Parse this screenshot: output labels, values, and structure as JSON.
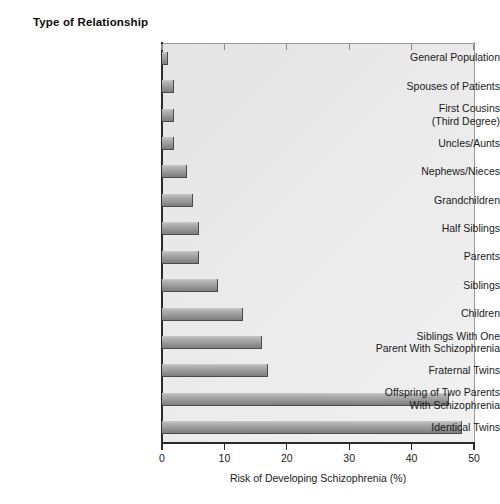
{
  "chart_data": {
    "type": "bar",
    "orientation": "horizontal",
    "title": "Type of Relationship",
    "xlabel": "Risk of Developing Schizophrenia (%)",
    "ylabel": "Type of Relationship",
    "xlim": [
      0,
      50
    ],
    "xticks": [
      0,
      10,
      20,
      30,
      40,
      50
    ],
    "xtick_labels": [
      "0",
      "10",
      "20",
      "30",
      "40",
      "50"
    ],
    "grid": false,
    "legend": null,
    "bar_color": "#9d9d9d",
    "plot_background": "#ebebeb",
    "categories": [
      "General Population",
      "Spouses of Patients",
      "First Cousins\n(Third Degree)",
      "Uncles/Aunts",
      "Nephews/Nieces",
      "Grandchildren",
      "Half Siblings",
      "Parents",
      "Siblings",
      "Children",
      "Siblings With One\nParent With Schizophrenia",
      "Fraternal Twins",
      "Offspring of Two Parents\nWith Schizophrenia",
      "Identical Twins"
    ],
    "values": [
      1,
      2,
      2,
      2,
      4,
      5,
      6,
      6,
      9,
      13,
      16,
      17,
      46,
      48
    ],
    "points": [
      {
        "label": "General Population",
        "value": 1
      },
      {
        "label": "Spouses of Patients",
        "value": 2
      },
      {
        "label": "First Cousins (Third Degree)",
        "value": 2
      },
      {
        "label": "Uncles/Aunts",
        "value": 2
      },
      {
        "label": "Nephews/Nieces",
        "value": 4
      },
      {
        "label": "Grandchildren",
        "value": 5
      },
      {
        "label": "Half Siblings",
        "value": 6
      },
      {
        "label": "Parents",
        "value": 6
      },
      {
        "label": "Siblings",
        "value": 9
      },
      {
        "label": "Children",
        "value": 13
      },
      {
        "label": "Siblings With One Parent With Schizophrenia",
        "value": 16
      },
      {
        "label": "Fraternal Twins",
        "value": 17
      },
      {
        "label": "Offspring of Two Parents With Schizophrenia",
        "value": 46
      },
      {
        "label": "Identical Twins",
        "value": 48
      }
    ]
  }
}
